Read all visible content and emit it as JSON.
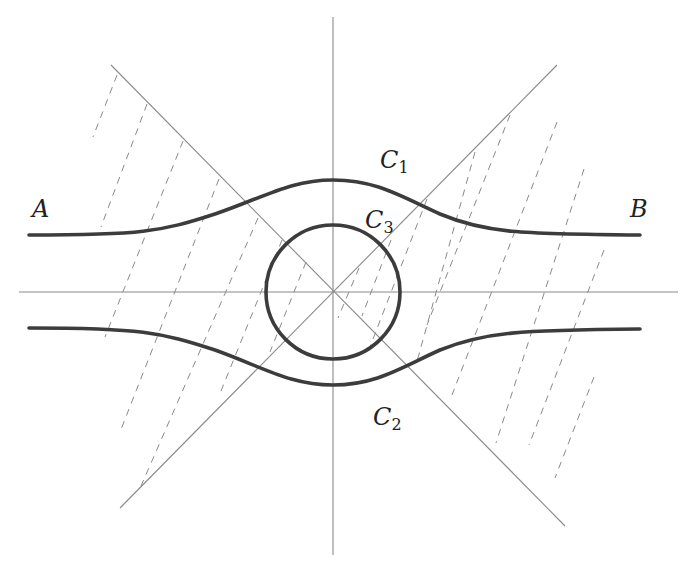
{
  "diagram": {
    "labels": {
      "A": "A",
      "B": "B",
      "C1": {
        "base": "C",
        "sub": "1"
      },
      "C2": {
        "base": "C",
        "sub": "2"
      },
      "C3": {
        "base": "C",
        "sub": "3"
      }
    },
    "colors": {
      "curve": "#3c3c3c",
      "thin_line": "#8a8a8a",
      "background": "#ffffff"
    },
    "elements": {
      "horizontal_axis": "horizontal line through origin",
      "vertical_axis": "vertical line through origin",
      "diagonal_lines": "two crossing diagonal lines through origin",
      "curve_C1": "upper bold curve from A to B, bulging upward near center",
      "curve_C2": "lower bold curve, symmetric to C1, bulging downward near center",
      "curve_C3": "bold circle centered at origin",
      "hatching": "dashed parallel lines filling left and right wedge regions"
    }
  }
}
